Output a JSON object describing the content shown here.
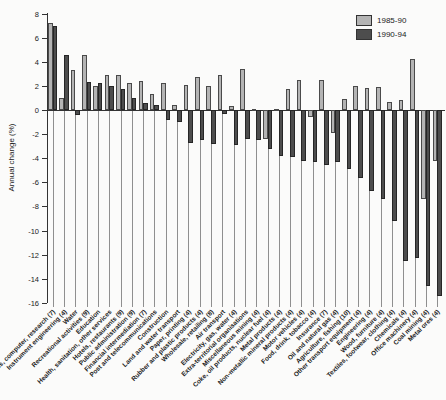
{
  "chart_data": {
    "type": "bar",
    "title": "Annual change by industry",
    "title_visibility": "clipped at top edge of screenshot",
    "ylabel": "Annual change (%)",
    "ylim": [
      -16,
      8
    ],
    "yticks": [
      8,
      6,
      4,
      2,
      0,
      -2,
      -4,
      -6,
      -8,
      -10,
      -12,
      -14,
      -16
    ],
    "grid": "vertical category drop-lines below zero axis",
    "legend_position": "top-right",
    "categories": [
      "Business, computer, research (7)",
      "Instrument engineering (4)",
      "Water",
      "Recreational activities (9)",
      "Education",
      "Health, sanitation, other services",
      "Hotels, restaurants (9)",
      "Public administration (9)",
      "Financial intermediation (7)",
      "Post and telecommunications",
      "Construction",
      "Land and water transport",
      "Paper, printing (4)",
      "Rubber and plastic products (4)",
      "Wholesale, retailing (8)",
      "Air transport",
      "Electricity, gas, water (4)",
      "Extra-territorial organisations",
      "Miscellaneous mining (4)",
      "Coke, oil products, nuclear fuel (4)",
      "Metal products (4)",
      "Non-metallic mineral products (4)",
      "Motor vehicles (4)",
      "Food, drink, tobacco (4)",
      "Insurance (7)",
      "Oil and natural gas (4)",
      "Agriculture, fishing (10)",
      "Other transport equipment (4)",
      "Engineering (4)",
      "Wood, furniture (4)",
      "Textiles, footwear, clothing (4)",
      "Chemicals (4)",
      "Office machinery (4)",
      "Coal mining (4)",
      "Metal ores (4)"
    ],
    "series": [
      {
        "name": "1985-90",
        "color": "#b4b4b4",
        "values": [
          7.2,
          1.0,
          3.3,
          4.6,
          2.0,
          2.9,
          2.9,
          2.2,
          2.4,
          1.3,
          2.2,
          0.4,
          2.1,
          2.7,
          2.0,
          2.9,
          0.3,
          3.4,
          0.1,
          -2.4,
          0.1,
          1.7,
          2.5,
          -0.6,
          2.5,
          -1.9,
          0.9,
          2.0,
          1.8,
          1.9,
          0.7,
          0.8,
          4.2,
          -7.4,
          -4.2
        ]
      },
      {
        "name": "1990-94",
        "color": "#4d4d4d",
        "values": [
          7.0,
          4.6,
          -0.4,
          2.3,
          2.2,
          2.0,
          1.7,
          1.0,
          0.6,
          0.4,
          -0.8,
          -1.0,
          -2.7,
          -2.5,
          -2.8,
          -0.3,
          -2.9,
          -2.4,
          -2.5,
          -3.2,
          -3.8,
          -3.9,
          -4.2,
          -4.3,
          -4.6,
          -4.3,
          -4.9,
          -5.6,
          -6.7,
          -7.4,
          -9.2,
          -12.5,
          -12.3,
          -14.6,
          -15.4
        ]
      }
    ]
  }
}
